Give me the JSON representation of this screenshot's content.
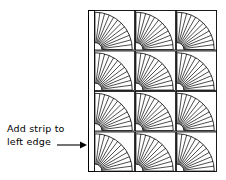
{
  "diagram": {
    "annotation": {
      "line1": "Add strip to",
      "line2": "left edge",
      "arrow_direction": "right",
      "arrow_target": "left-edge-strip"
    },
    "quilt": {
      "outer_border_color": "#000000",
      "fill_color": "#ffffff",
      "line_color": "#000000",
      "rows": 4,
      "columns": 3,
      "block_count": 12,
      "block_type": "fan",
      "fan": {
        "wedge_count": 12,
        "pivot_corner": "bottom-left",
        "inner_arc_radius_ratio": 0.17,
        "outer_arc_radius_ratio": 0.92,
        "sweep_degrees": 90
      },
      "left_strip": {
        "label": "left edge strip",
        "position": "left",
        "width_px": 6
      },
      "geometry": {
        "x": 88,
        "y": 10,
        "width": 129,
        "height": 162,
        "strip_x": 88,
        "strip_width": 6,
        "grid_x": 94,
        "grid_width": 123,
        "col_edges": [
          94,
          135,
          176,
          217
        ],
        "row_edges": [
          10,
          50.5,
          91,
          131.5,
          172
        ]
      }
    }
  }
}
